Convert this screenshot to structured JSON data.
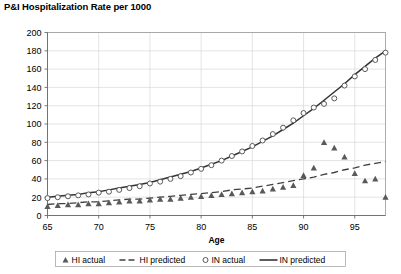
{
  "chart": {
    "title": "P&I Hospitalization Rate per 1000",
    "xlabel": "Age",
    "ylabel": ""
  },
  "legend": {
    "items": [
      {
        "label": "HI actual",
        "marker": "triangle-marker",
        "color": "#595959"
      },
      {
        "label": "HI predicted",
        "marker": "dashed-line",
        "color": "#404040"
      },
      {
        "label": "IN actual",
        "marker": "circle-marker",
        "color": "#595959"
      },
      {
        "label": "IN predicted",
        "marker": "solid-line",
        "color": "#333333"
      }
    ]
  },
  "chart_data": {
    "type": "scatter",
    "title": "P&I Hospitalization Rate per 1000",
    "xlabel": "Age",
    "ylabel": "P&I Hospitalization Rate per 1000",
    "xlim": [
      65,
      98
    ],
    "ylim": [
      0,
      200
    ],
    "xticks": [
      65,
      70,
      75,
      80,
      85,
      90,
      95
    ],
    "yticks": [
      0,
      20,
      40,
      60,
      80,
      100,
      120,
      140,
      160,
      180,
      200
    ],
    "grid": true,
    "legend_position": "bottom",
    "x": [
      65,
      66,
      67,
      68,
      69,
      70,
      71,
      72,
      73,
      74,
      75,
      76,
      77,
      78,
      79,
      80,
      81,
      82,
      83,
      84,
      85,
      86,
      87,
      88,
      89,
      90,
      91,
      92,
      93,
      94,
      95,
      96,
      97,
      98
    ],
    "series": [
      {
        "name": "HI actual",
        "type": "scatter",
        "marker": "triangle",
        "color": "#595959",
        "values": [
          10,
          11,
          12,
          12,
          13,
          13,
          14,
          15,
          16,
          16,
          17,
          18,
          18,
          19,
          20,
          21,
          22,
          23,
          24,
          25,
          26,
          27,
          29,
          31,
          33,
          44,
          52,
          80,
          74,
          64,
          46,
          38,
          40,
          20
        ]
      },
      {
        "name": "HI predicted",
        "type": "line",
        "style": "dashed",
        "color": "#404040",
        "values": [
          12,
          13,
          13,
          14,
          15,
          15,
          16,
          17,
          18,
          18,
          19,
          20,
          21,
          22,
          23,
          24,
          25,
          26,
          28,
          29,
          30,
          32,
          34,
          36,
          38,
          40,
          42,
          45,
          47,
          50,
          52,
          55,
          57,
          59
        ]
      },
      {
        "name": "IN actual",
        "type": "scatter",
        "marker": "circle",
        "color": "#595959",
        "values": [
          19,
          20,
          21,
          22,
          23,
          25,
          26,
          28,
          30,
          32,
          35,
          37,
          40,
          43,
          47,
          51,
          55,
          60,
          65,
          70,
          76,
          82,
          89,
          96,
          104,
          112,
          118,
          122,
          128,
          142,
          152,
          160,
          170,
          178
        ]
      },
      {
        "name": "IN predicted",
        "type": "line",
        "style": "solid",
        "color": "#333333",
        "values": [
          20,
          21,
          22,
          23,
          25,
          26,
          28,
          30,
          32,
          34,
          36,
          39,
          42,
          45,
          48,
          52,
          56,
          60,
          65,
          70,
          75,
          81,
          87,
          94,
          101,
          109,
          117,
          126,
          135,
          144,
          154,
          163,
          172,
          180
        ]
      }
    ]
  }
}
